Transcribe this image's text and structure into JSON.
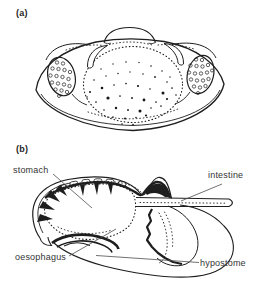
{
  "figure": {
    "panel_a": {
      "tag": "(a)",
      "description": "dorsal view of larval arthropod with stippled compound eyes and speckled central dome"
    },
    "panel_b": {
      "tag": "(b)",
      "description": "sagittal section of head showing digestive tract",
      "labels": {
        "stomach": "stomach",
        "intestine": "intestine",
        "oesophagus": "oesophagus",
        "hypostome": "hypostome"
      }
    },
    "colors": {
      "ink": "#1e1e1e",
      "label_text": "#343434",
      "leader_line": "#4d4d4d",
      "background": "#ffffff"
    }
  }
}
